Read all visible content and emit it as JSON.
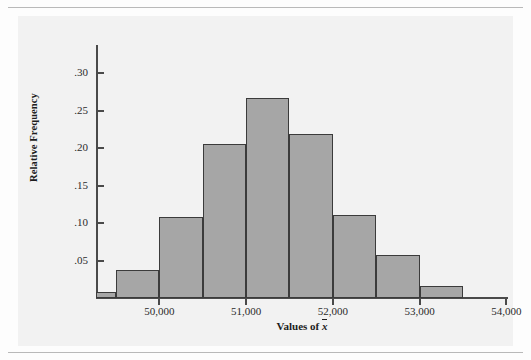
{
  "figure": {
    "background_color": "#f2f2f2",
    "bar_fill_color": "#a6a6a6",
    "bar_edge_color": "#3b3b3b",
    "axis_color": "#4a4a4a"
  },
  "chart_data": {
    "type": "bar",
    "title": "",
    "subtitle": "",
    "xlabel": "Values of x̄",
    "ylabel": "Relative Frequency",
    "xlim": [
      49270,
      54020
    ],
    "ylim": [
      0,
      0.335
    ],
    "xticks": [
      50000,
      51000,
      52000,
      53000,
      54000
    ],
    "xtick_labels": [
      "50,000",
      "51,000",
      "52,000",
      "53,000",
      "54,000"
    ],
    "yticks": [
      0.05,
      0.1,
      0.15,
      0.2,
      0.25,
      0.3
    ],
    "ytick_labels": [
      ".05",
      ".10",
      ".15",
      ".20",
      ".25",
      ".30"
    ],
    "grid": false,
    "legend": null,
    "bin_width": 500,
    "bins": [
      {
        "left": 49270,
        "right": 49500,
        "value": 0.008
      },
      {
        "left": 49500,
        "right": 50000,
        "value": 0.037
      },
      {
        "left": 50000,
        "right": 50500,
        "value": 0.108
      },
      {
        "left": 50500,
        "right": 51000,
        "value": 0.205
      },
      {
        "left": 51000,
        "right": 51500,
        "value": 0.267
      },
      {
        "left": 51500,
        "right": 52000,
        "value": 0.219
      },
      {
        "left": 52000,
        "right": 52500,
        "value": 0.111
      },
      {
        "left": 52500,
        "right": 53000,
        "value": 0.058
      },
      {
        "left": 53000,
        "right": 53500,
        "value": 0.016
      }
    ],
    "categories": [
      "49,270-49,500",
      "49,500-50,000",
      "50,000-50,500",
      "50,500-51,000",
      "51,000-51,500",
      "51,500-52,000",
      "52,000-52,500",
      "52,500-53,000",
      "53,000-53,500"
    ],
    "values": [
      0.008,
      0.037,
      0.108,
      0.205,
      0.267,
      0.219,
      0.111,
      0.058,
      0.016
    ]
  }
}
